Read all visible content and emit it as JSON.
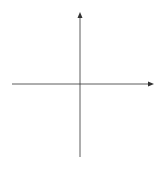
{
  "figure": {
    "caption": "(b)",
    "x_axis_label": "x",
    "y_axis_label": "y",
    "x_ticks": [
      {
        "value": -3,
        "label": "−3"
      },
      {
        "value": -2,
        "label": "−2"
      },
      {
        "value": -1,
        "label": "−1"
      },
      {
        "value": 1,
        "label": "1"
      },
      {
        "value": 2,
        "label": "2"
      },
      {
        "value": 3,
        "label": "3"
      }
    ],
    "curve_description": "Cubic curve with a closed oval loop from x≈−2.2 to x=1 and an unbounded branch starting near x≈1.25 opening to the right",
    "line_color": "#1a1a1a"
  }
}
